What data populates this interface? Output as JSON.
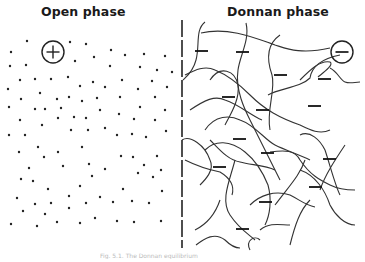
{
  "figure": {
    "left_panel": {
      "title": "Open phase",
      "ion_symbol": "+",
      "ion_icon": "circled-plus-icon",
      "content": "scattered dots (mobile ions)"
    },
    "right_panel": {
      "title": "Donnan phase",
      "ion_symbol": "−",
      "ion_icon": "circled-minus-icon",
      "content": "tangled polymer chains bearing fixed negative charges"
    },
    "divider": "dashed vertical line",
    "caption": "Fig. 5.1. The Donnan equilibrium"
  },
  "colors": {
    "ink": "#2a2a2a",
    "background": "#ffffff"
  }
}
